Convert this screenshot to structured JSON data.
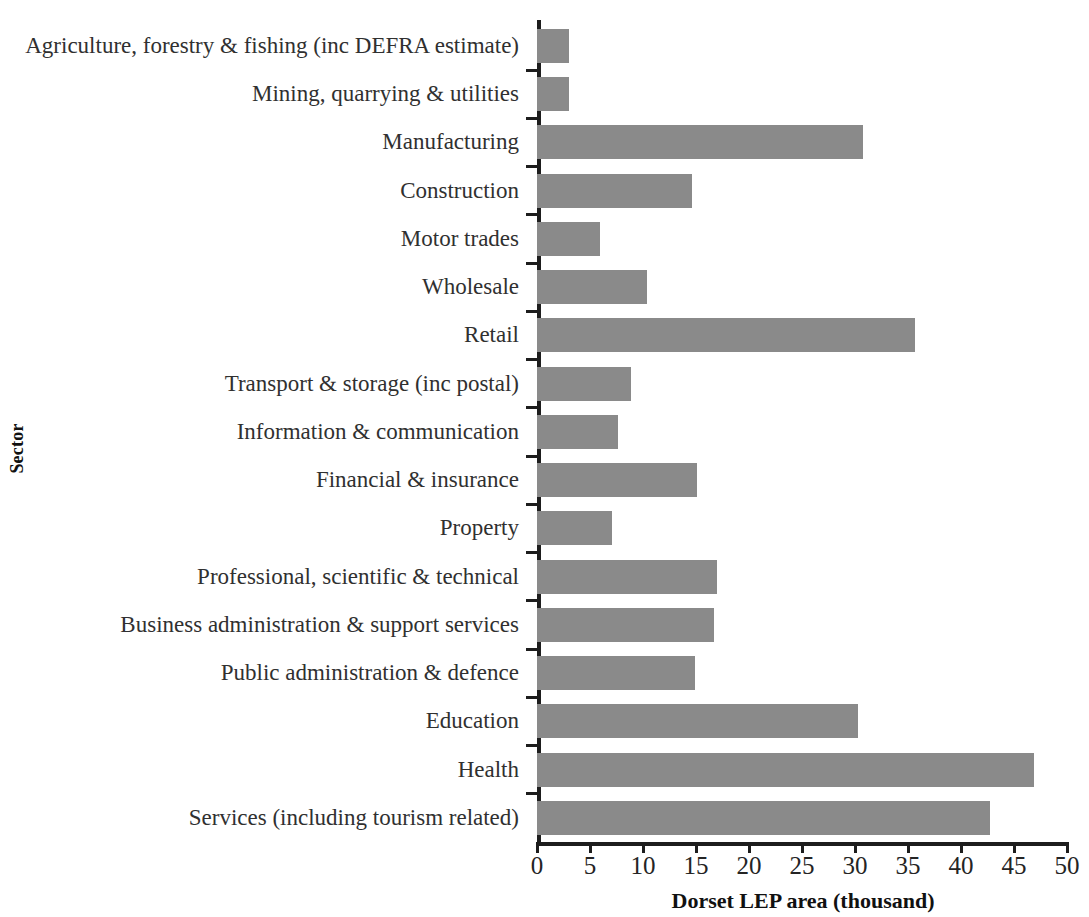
{
  "chart_data": {
    "type": "bar",
    "orientation": "horizontal",
    "title": "",
    "xlabel": "Dorset LEP area (thousand)",
    "ylabel": "Sector",
    "xlim": [
      0,
      50
    ],
    "xticks": [
      0,
      5,
      10,
      15,
      20,
      25,
      30,
      35,
      40,
      45,
      50
    ],
    "grid": false,
    "legend": null,
    "bar_color": "#8a8a8a",
    "axis_color": "#1d1d1d",
    "categories": [
      "Agriculture, forestry & fishing (inc DEFRA estimate)",
      "Mining, quarrying & utilities",
      "Manufacturing",
      "Construction",
      "Motor trades",
      "Wholesale",
      "Retail",
      "Transport & storage (inc postal)",
      "Information & communication",
      "Financial & insurance",
      "Property",
      "Professional, scientific & technical",
      "Business administration & support services",
      "Public administration & defence",
      "Education",
      "Health",
      "Services (including tourism related)"
    ],
    "values": [
      3.0,
      3.0,
      30.8,
      14.6,
      5.9,
      10.4,
      35.7,
      8.9,
      7.6,
      15.1,
      7.1,
      17.0,
      16.7,
      14.9,
      30.3,
      46.9,
      42.7
    ]
  }
}
